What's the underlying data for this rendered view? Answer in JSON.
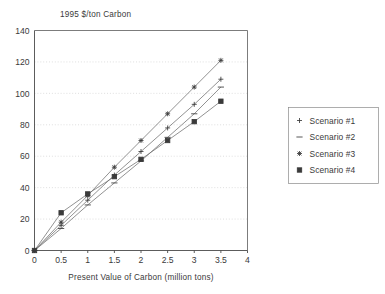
{
  "chart_data": {
    "type": "line",
    "title": "1995 $/ton Carbon",
    "xlabel": "Present Value of Carbon (million tons)",
    "ylabel": "",
    "xlim": [
      0,
      4
    ],
    "ylim": [
      0,
      140
    ],
    "xticks": [
      "0",
      "0.5",
      "1",
      "1.5",
      "2",
      "2.5",
      "3",
      "3.5",
      "4"
    ],
    "xtick_values": [
      0,
      0.5,
      1,
      1.5,
      2,
      2.5,
      3,
      3.5,
      4
    ],
    "yticks": [
      "0",
      "20",
      "40",
      "60",
      "80",
      "100",
      "120",
      "140"
    ],
    "ytick_values": [
      0,
      20,
      40,
      60,
      80,
      100,
      120,
      140
    ],
    "grid": true,
    "grid_axis": "y",
    "legend_position": "right-outside",
    "x": [
      0,
      0.5,
      1,
      1.5,
      2,
      2.5,
      3,
      3.5
    ],
    "series": [
      {
        "name": "Scenario #1",
        "marker": "plus",
        "values": [
          0,
          16,
          32,
          48,
          63,
          78,
          93,
          109
        ]
      },
      {
        "name": "Scenario #2",
        "marker": "dash",
        "values": [
          0,
          14,
          29,
          43,
          57,
          72,
          87,
          104
        ]
      },
      {
        "name": "Scenario #3",
        "marker": "asterisk",
        "values": [
          0,
          18,
          35,
          53,
          70,
          87,
          104,
          121
        ]
      },
      {
        "name": "Scenario #4",
        "marker": "square",
        "values": [
          0,
          24,
          36,
          47,
          58,
          70,
          82,
          95
        ]
      }
    ]
  },
  "legend": {
    "entries": [
      {
        "label": "Scenario #1"
      },
      {
        "label": "Scenario #2"
      },
      {
        "label": "Scenario #3"
      },
      {
        "label": "Scenario #4"
      }
    ]
  },
  "colors": {
    "line": "#6e6e6e",
    "marker": "#3a3a3a",
    "grid": "#c9c9c9",
    "axis": "#4a4a4a",
    "text": "#3a3a3a",
    "background": "#ffffff"
  }
}
